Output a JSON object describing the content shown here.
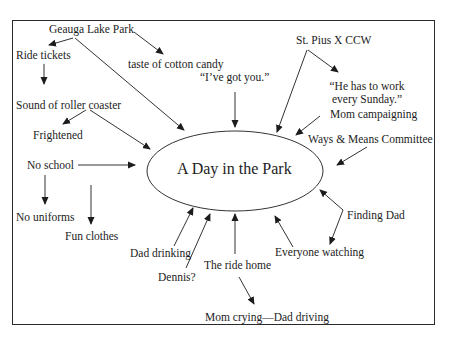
{
  "diagram": {
    "center": "A Day in the Park",
    "nodes": {
      "geauga_lake_park": "Geauga Lake Park",
      "ride_tickets": "Ride tickets",
      "taste_of_cotton_candy": "taste of cotton candy",
      "ive_got_you": "“I’ve got you.”",
      "st_pius": "St. Pius X CCW",
      "he_has_to_work_line1": "“He has to work",
      "he_has_to_work_line2": "every Sunday.”",
      "mom_campaigning": "Mom campaigning",
      "ways_means": "Ways & Means Committee",
      "sound_of_roller_coaster": "Sound of roller coaster",
      "frightened": "Frightened",
      "no_school": "No school",
      "no_uniforms": "No uniforms",
      "fun_clothes": "Fun clothes",
      "finding_dad": "Finding Dad",
      "everyone_watching": "Everyone watching",
      "dad_drinking": "Dad drinking",
      "dennis": "Dennis?",
      "ride_home": "The ride home",
      "mom_crying": "Mom crying—Dad driving"
    },
    "edges": [
      {
        "from": "Geauga Lake Park",
        "to": "Ride tickets"
      },
      {
        "from": "Geauga Lake Park",
        "to": "taste of cotton candy"
      },
      {
        "from": "Geauga Lake Park",
        "to": "A Day in the Park"
      },
      {
        "from": "Ride tickets",
        "to": "Sound of roller coaster"
      },
      {
        "from": "Sound of roller coaster",
        "to": "Frightened"
      },
      {
        "from": "Sound of roller coaster",
        "to": "A Day in the Park"
      },
      {
        "from": "No school",
        "to": "A Day in the Park"
      },
      {
        "from": "No school",
        "to": "No uniforms"
      },
      {
        "from": "No school",
        "to": "Fun clothes"
      },
      {
        "from": "“I’ve got you.”",
        "to": "A Day in the Park"
      },
      {
        "from": "St. Pius X CCW",
        "to": "“He has to work every Sunday.”"
      },
      {
        "from": "St. Pius X CCW",
        "to": "A Day in the Park"
      },
      {
        "from": "Mom campaigning",
        "to": "A Day in the Park"
      },
      {
        "from": "Ways & Means Committee",
        "to": "A Day in the Park"
      },
      {
        "from": "Finding Dad",
        "to": "A Day in the Park"
      },
      {
        "from": "Finding Dad",
        "to": "Everyone watching"
      },
      {
        "from": "Everyone watching",
        "to": "A Day in the Park"
      },
      {
        "from": "The ride home",
        "to": "A Day in the Park"
      },
      {
        "from": "The ride home",
        "to": "Mom crying—Dad driving"
      },
      {
        "from": "Dad drinking",
        "to": "A Day in the Park"
      },
      {
        "from": "Dennis?",
        "to": "A Day in the Park"
      }
    ]
  }
}
